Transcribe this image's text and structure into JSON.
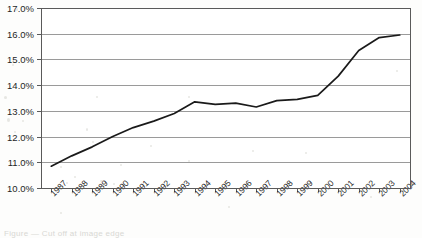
{
  "chart_data": {
    "type": "line",
    "title": "",
    "subtitle": "",
    "xlabel": "",
    "ylabel": "",
    "categories": [
      "1987",
      "1988",
      "1989",
      "1990",
      "1991",
      "1992",
      "1993",
      "1994",
      "1995",
      "1996",
      "1997",
      "1998",
      "1999",
      "2000",
      "2001",
      "2002",
      "2003",
      "2004"
    ],
    "values": [
      10.85,
      11.25,
      11.6,
      12.0,
      12.35,
      12.6,
      12.9,
      13.35,
      13.25,
      13.3,
      13.15,
      13.4,
      13.45,
      13.6,
      14.35,
      15.35,
      15.85,
      15.95
    ],
    "series": [
      {
        "name": "",
        "values": [
          10.85,
          11.25,
          11.6,
          12.0,
          12.35,
          12.6,
          12.9,
          13.35,
          13.25,
          13.3,
          13.15,
          13.4,
          13.45,
          13.6,
          14.35,
          15.35,
          15.85,
          15.95
        ]
      }
    ],
    "ylim": [
      10.0,
      17.0
    ],
    "ytick_labels": [
      "17.0%",
      "16.0%",
      "15.0%",
      "14.0%",
      "13.0%",
      "12.0%",
      "11.0%",
      "10.0%"
    ],
    "ytick_values": [
      17.0,
      16.0,
      15.0,
      14.0,
      13.0,
      12.0,
      11.0,
      10.0
    ],
    "ytick_format": "percent",
    "xtick_labels": [
      "1987",
      "1988",
      "1989",
      "1990",
      "1991",
      "1992",
      "1993",
      "1994",
      "1995",
      "1996",
      "1997",
      "1998",
      "1999",
      "2000",
      "2001",
      "2002",
      "2003",
      "2004"
    ],
    "xtick_rotation": 45,
    "grid": "horizontal",
    "legend": "none",
    "line_color": "#1a1a1a",
    "grid_color": "#9a9a9a",
    "frame_color": "#5a5a5a",
    "plot_background": "#ffffff",
    "markers": "none",
    "annotations": []
  },
  "caption": {
    "clipped_text": "Figure — Cut off at image edge"
  }
}
